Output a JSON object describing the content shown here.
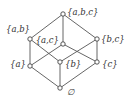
{
  "diagram": {
    "type": "hasse-diagram",
    "nodes": [
      {
        "id": "abc",
        "label": "{a,b,c}",
        "x": 63,
        "y": 14,
        "lx": 67,
        "ly": 15,
        "anchor": "start"
      },
      {
        "id": "ab",
        "label": "{a,b}",
        "x": 30,
        "y": 39,
        "lx": 6,
        "ly": 32,
        "anchor": "start"
      },
      {
        "id": "ac",
        "label": "{a,c}",
        "x": 63,
        "y": 44,
        "lx": 59,
        "ly": 43,
        "anchor": "end"
      },
      {
        "id": "bc",
        "label": "{b,c}",
        "x": 97,
        "y": 39,
        "lx": 101,
        "ly": 42,
        "anchor": "start"
      },
      {
        "id": "a",
        "label": "{a}",
        "x": 30,
        "y": 66,
        "lx": 26,
        "ly": 67,
        "anchor": "end"
      },
      {
        "id": "b",
        "label": "{b}",
        "x": 60,
        "y": 62,
        "lx": 65,
        "ly": 67,
        "anchor": "start"
      },
      {
        "id": "c",
        "label": "{c}",
        "x": 97,
        "y": 62,
        "lx": 102,
        "ly": 67,
        "anchor": "start"
      },
      {
        "id": "empty",
        "label": "∅",
        "x": 60,
        "y": 88,
        "lx": 67,
        "ly": 95,
        "anchor": "start"
      }
    ],
    "edges": [
      [
        "empty",
        "a"
      ],
      [
        "empty",
        "b"
      ],
      [
        "empty",
        "c"
      ],
      [
        "a",
        "ab"
      ],
      [
        "a",
        "ac"
      ],
      [
        "b",
        "ab"
      ],
      [
        "b",
        "bc"
      ],
      [
        "c",
        "ac"
      ],
      [
        "c",
        "bc"
      ],
      [
        "ab",
        "abc"
      ],
      [
        "ac",
        "abc"
      ],
      [
        "bc",
        "abc"
      ]
    ],
    "colors": {
      "line": "#555555",
      "node_fill": "#ffffff",
      "text": "#333333",
      "background": "#ffffff"
    }
  }
}
